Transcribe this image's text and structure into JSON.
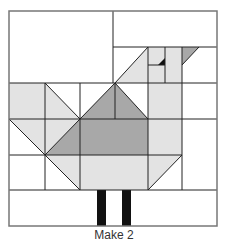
{
  "diagram": {
    "caption": "Make 2",
    "colors": {
      "background": "#ffffff",
      "light_fabric": "#e3e3e3",
      "medium_fabric": "#a8a8a8",
      "dark_fabric": "#111111",
      "seam_line": "#222222",
      "border_line": "#777777"
    }
  }
}
